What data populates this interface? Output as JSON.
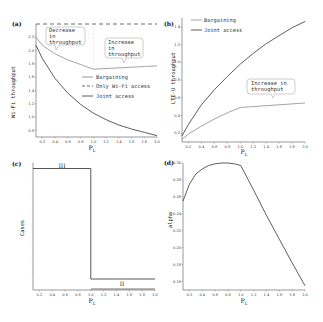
{
  "chart_data": [
    {
      "panel": "(a)",
      "type": "line",
      "xlabel": "P_L",
      "ylabel": "Wi-Fi throughput",
      "xlim": [
        0.1,
        2.0
      ],
      "ylim": [
        0.7,
        2.4
      ],
      "xticks": [
        "0.2",
        "0.4",
        "0.6",
        "0.8",
        "1.0",
        "1.2",
        "1.4",
        "1.6",
        "1.8",
        "2.0"
      ],
      "yticks": [
        "0.8",
        "1.0",
        "1.2",
        "1.4",
        "1.6",
        "1.8",
        "2.0",
        "2.2"
      ],
      "series": [
        {
          "name": "Bargaining",
          "style": "solid-thin",
          "x": [
            0.1,
            0.2,
            0.4,
            0.6,
            0.8,
            1.0,
            1.2,
            1.4,
            1.6,
            1.8,
            2.0
          ],
          "y": [
            2.2,
            2.08,
            1.95,
            1.86,
            1.79,
            1.72,
            1.73,
            1.74,
            1.75,
            1.76,
            1.77
          ]
        },
        {
          "name": "Only Wi-Fi access",
          "style": "dashed",
          "x": [
            0.1,
            2.0
          ],
          "y": [
            2.4,
            2.4
          ]
        },
        {
          "name": "Joint access",
          "style": "solid",
          "x": [
            0.1,
            0.2,
            0.4,
            0.6,
            0.8,
            1.0,
            1.2,
            1.4,
            1.6,
            1.8,
            2.0
          ],
          "y": [
            2.08,
            1.88,
            1.58,
            1.36,
            1.19,
            1.06,
            0.96,
            0.88,
            0.82,
            0.77,
            0.72
          ]
        }
      ],
      "annotations": [
        {
          "text": "Decrease in throughput",
          "lines": [
            "Decrease",
            "in",
            "throughput"
          ]
        },
        {
          "text": "Increase in throughput",
          "lines": [
            "Increase",
            "in",
            "throughput"
          ]
        }
      ],
      "grid": false,
      "legend_position": "center-right"
    },
    {
      "panel": "(b)",
      "type": "line",
      "xlabel": "P_L",
      "ylabel": "LTE-U throughput",
      "xlim": [
        0.1,
        2.0
      ],
      "ylim": [
        0.1,
        1.5
      ],
      "xticks": [
        "0.2",
        "0.4",
        "0.6",
        "0.8",
        "1.0",
        "1.2",
        "1.4",
        "1.6",
        "1.8",
        "2.0"
      ],
      "yticks": [
        "0.2",
        "0.4",
        "0.6",
        "0.8",
        "1.0",
        "1.2",
        "1.4"
      ],
      "series": [
        {
          "name": "Bargaining",
          "style": "solid-thin",
          "x": [
            0.1,
            0.2,
            0.4,
            0.6,
            0.8,
            1.0,
            1.2,
            1.4,
            1.6,
            1.8,
            2.0
          ],
          "y": [
            0.13,
            0.19,
            0.28,
            0.36,
            0.43,
            0.49,
            0.5,
            0.51,
            0.52,
            0.53,
            0.54
          ]
        },
        {
          "name": "Joint access",
          "style": "solid",
          "x": [
            0.1,
            0.2,
            0.4,
            0.6,
            0.8,
            1.0,
            1.2,
            1.4,
            1.6,
            1.8,
            2.0
          ],
          "y": [
            0.17,
            0.3,
            0.52,
            0.69,
            0.84,
            0.98,
            1.1,
            1.21,
            1.3,
            1.39,
            1.46
          ]
        }
      ],
      "annotations": [
        {
          "text": "Increase in throughput",
          "lines": [
            "Increase in",
            "throughput"
          ]
        }
      ],
      "grid": false,
      "legend_position": "upper-left"
    },
    {
      "panel": "(c)",
      "type": "line",
      "xlabel": "P_L",
      "ylabel": "Cases",
      "xlim": [
        0.1,
        2.0
      ],
      "xticks": [
        "0.2",
        "0.4",
        "0.6",
        "0.8",
        "1.0",
        "1.2",
        "1.4",
        "1.6",
        "1.8",
        "2.0"
      ],
      "series": [
        {
          "name": "Cases",
          "x": [
            0.1,
            1.0,
            1.0,
            2.0
          ],
          "y": [
            3,
            3,
            2,
            2
          ]
        }
      ],
      "region_labels": [
        "III",
        "II"
      ],
      "grid": false
    },
    {
      "panel": "(d)",
      "type": "line",
      "xlabel": "P_L",
      "ylabel": "alpha",
      "xlim": [
        0.1,
        2.0
      ],
      "ylim": [
        0.15,
        0.3
      ],
      "xticks": [
        "0.2",
        "0.4",
        "0.6",
        "0.8",
        "1.0",
        "1.2",
        "1.4",
        "1.6",
        "1.8",
        "2.0"
      ],
      "yticks": [
        "0.16",
        "0.18",
        "0.20",
        "0.22",
        "0.24",
        "0.26",
        "0.28",
        "0.30"
      ],
      "series": [
        {
          "name": "alpha",
          "x": [
            0.1,
            0.2,
            0.3,
            0.4,
            0.5,
            0.6,
            0.7,
            0.8,
            0.9,
            1.0,
            1.2,
            1.4,
            1.6,
            1.8,
            2.0
          ],
          "y": [
            0.255,
            0.275,
            0.287,
            0.293,
            0.297,
            0.299,
            0.3,
            0.3,
            0.299,
            0.297,
            0.268,
            0.238,
            0.21,
            0.182,
            0.155
          ]
        }
      ],
      "grid": false
    }
  ],
  "labels": {
    "a": {
      "panel": "(a)",
      "ylabel": "Wi-Fi throughput",
      "xlabel": "P",
      "xsub": "L",
      "legend": [
        "Bargaining",
        "Only Wi-Fi access",
        "Joint access"
      ],
      "ann1": [
        "Decrease",
        "in",
        "throughput"
      ],
      "ann2": [
        "Increase",
        "in",
        "throughput"
      ]
    },
    "b": {
      "panel": "(b)",
      "ylabel": "LTE-U throughput",
      "xlabel": "P",
      "xsub": "L",
      "legend": [
        "Bargaining",
        "Joint access"
      ],
      "ann": [
        "Increase in",
        "throughput"
      ]
    },
    "c": {
      "panel": "(c)",
      "ylabel": "Cases",
      "xlabel": "P",
      "xsub": "L",
      "r3": "III",
      "r2": "II"
    },
    "d": {
      "panel": "(d)",
      "ylabel": "alpha",
      "xlabel": "P",
      "xsub": "L"
    }
  }
}
